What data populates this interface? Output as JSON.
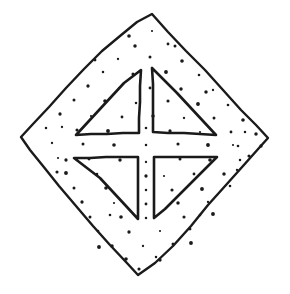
{
  "figure": {
    "title": "Stippled diamond with four triangles forming a central cross",
    "medium": "pen-and-ink line drawing",
    "background_color": "#ffffff",
    "ink_color": "#1a1a1a",
    "canvas": {
      "width": 290,
      "height": 294
    },
    "outline_stroke_width": 2.4,
    "triangle_stroke_width": 2.6,
    "dot_radius": 1.5,
    "diamond": {
      "name": "rhombus-outline",
      "vertices": [
        {
          "label": "top",
          "x": 152,
          "y": 14
        },
        {
          "label": "right",
          "x": 268,
          "y": 138
        },
        {
          "label": "bottom",
          "x": 138,
          "y": 275
        },
        {
          "label": "left",
          "x": 21,
          "y": 137
        }
      ],
      "path": "M152,14 L168,32 L186,51 L205,70 L223,90 L241,110 L256,125 L268,138 L259,148 L243,166 L226,185 L208,205 L191,226 L173,246 L155,263 L138,275 L126,262 L110,245 L93,226 L76,206 L59,186 L43,166 L30,150 L21,137 L33,124 L49,107 L66,88 L84,69 L102,51 L120,36 L137,22 Z"
    },
    "triangles": [
      {
        "name": "upper-left-triangle",
        "orientation": "right-angle at bottom-right",
        "path": "M141,70 L140,86 L140,102 L139,118 L139,133 L123,133 L107,134 L91,134 L76,135 L88,122 L100,109 L112,96 L124,83 Z"
      },
      {
        "name": "upper-right-triangle",
        "orientation": "right-angle at bottom-left",
        "path": "M152,68 L153,84 L153,100 L153,116 L153,132 L168,133 L184,133 L200,134 L216,135 L203,121 L190,107 L177,93 L164,80 Z"
      },
      {
        "name": "lower-left-triangle",
        "orientation": "right-angle at top-right",
        "path": "M74,158 L90,158 L106,157 L122,157 L138,157 L138,173 L138,189 L138,204 L138,219 L126,206 L113,192 L100,178 L87,168 Z"
      },
      {
        "name": "lower-right-triangle",
        "orientation": "right-angle at top-left",
        "path": "M154,157 L170,157 L186,157 L202,157 L217,157 L204,170 L191,183 L178,196 L165,209 L154,218 L154,202 L154,186 L154,172 Z"
      }
    ],
    "central_motif": {
      "name": "cross-negative-space",
      "shape": "equal-armed cross",
      "center": {
        "x": 146,
        "y": 145
      },
      "arm_width": 24
    },
    "stipple_dots": [
      [
        152,
        31
      ],
      [
        168,
        44
      ],
      [
        135,
        46
      ],
      [
        118,
        59
      ],
      [
        150,
        57
      ],
      [
        182,
        61
      ],
      [
        103,
        72
      ],
      [
        133,
        74
      ],
      [
        166,
        72
      ],
      [
        199,
        75
      ],
      [
        88,
        86
      ],
      [
        119,
        88
      ],
      [
        150,
        88
      ],
      [
        181,
        89
      ],
      [
        213,
        90
      ],
      [
        74,
        100
      ],
      [
        105,
        101
      ],
      [
        136,
        103
      ],
      [
        168,
        101
      ],
      [
        198,
        104
      ],
      [
        228,
        105
      ],
      [
        60,
        114
      ],
      [
        91,
        116
      ],
      [
        122,
        117
      ],
      [
        153,
        116
      ],
      [
        184,
        118
      ],
      [
        214,
        118
      ],
      [
        243,
        120
      ],
      [
        46,
        128
      ],
      [
        77,
        130
      ],
      [
        108,
        131
      ],
      [
        146,
        128
      ],
      [
        170,
        131
      ],
      [
        200,
        132
      ],
      [
        231,
        132
      ],
      [
        256,
        134
      ],
      [
        52,
        143
      ],
      [
        83,
        144
      ],
      [
        114,
        145
      ],
      [
        146,
        145
      ],
      [
        178,
        144
      ],
      [
        208,
        145
      ],
      [
        238,
        146
      ],
      [
        261,
        146
      ],
      [
        58,
        158
      ],
      [
        89,
        159
      ],
      [
        120,
        160
      ],
      [
        146,
        162
      ],
      [
        180,
        159
      ],
      [
        210,
        160
      ],
      [
        240,
        160
      ],
      [
        249,
        156
      ],
      [
        66,
        173
      ],
      [
        97,
        174
      ],
      [
        146,
        176
      ],
      [
        164,
        176
      ],
      [
        194,
        174
      ],
      [
        224,
        174
      ],
      [
        237,
        170
      ],
      [
        74,
        188
      ],
      [
        106,
        188
      ],
      [
        146,
        190
      ],
      [
        172,
        190
      ],
      [
        202,
        189
      ],
      [
        230,
        186
      ],
      [
        82,
        202
      ],
      [
        114,
        203
      ],
      [
        146,
        204
      ],
      [
        178,
        203
      ],
      [
        208,
        202
      ],
      [
        90,
        217
      ],
      [
        121,
        217
      ],
      [
        146,
        218
      ],
      [
        184,
        217
      ],
      [
        213,
        214
      ],
      [
        98,
        231
      ],
      [
        129,
        232
      ],
      [
        160,
        231
      ],
      [
        190,
        229
      ],
      [
        112,
        246
      ],
      [
        143,
        246
      ],
      [
        173,
        244
      ],
      [
        126,
        259
      ],
      [
        156,
        257
      ],
      [
        139,
        269
      ],
      [
        99,
        247
      ],
      [
        200,
        215
      ],
      [
        66,
        160
      ],
      [
        233,
        145
      ],
      [
        95,
        60
      ],
      [
        206,
        92
      ],
      [
        62,
        127
      ],
      [
        175,
        46
      ],
      [
        129,
        36
      ],
      [
        245,
        132
      ],
      [
        57,
        172
      ],
      [
        191,
        243
      ],
      [
        110,
        215
      ],
      [
        160,
        260
      ]
    ]
  }
}
